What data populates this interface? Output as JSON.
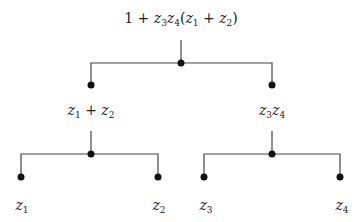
{
  "diagram": {
    "type": "expression-tree",
    "colors": {
      "line": "#444444",
      "node": "#111111",
      "text": "#222222",
      "background": "#ffffff"
    },
    "nodes": [
      {
        "id": "root",
        "label": "1 + z3z4(z1 + z2)",
        "label_parts": [
          "1 + ",
          "z",
          "3",
          "z",
          "4",
          "(",
          "z",
          "1",
          " + ",
          "z",
          "2",
          ")"
        ],
        "x": 181,
        "y": 63,
        "label_x": 181,
        "label_y": 19
      },
      {
        "id": "sum",
        "label": "z1 + z2",
        "x": 91,
        "y": 85,
        "label_x": 91,
        "label_y": 111
      },
      {
        "id": "prod",
        "label": "z3z4",
        "x": 272,
        "y": 85,
        "label_x": 272,
        "label_y": 111
      },
      {
        "id": "z1",
        "label": "z1",
        "x": 21,
        "y": 177,
        "label_x": 21,
        "label_y": 206
      },
      {
        "id": "z2",
        "label": "z2",
        "x": 158,
        "y": 177,
        "label_x": 158,
        "label_y": 206
      },
      {
        "id": "z3",
        "label": "z3",
        "x": 204,
        "y": 177,
        "label_x": 205,
        "label_y": 206
      },
      {
        "id": "z4",
        "label": "z4",
        "x": 340,
        "y": 177,
        "label_x": 341,
        "label_y": 206
      }
    ],
    "edges": [
      {
        "from": "root",
        "to": "sum"
      },
      {
        "from": "root",
        "to": "prod"
      },
      {
        "from": "sum",
        "to": "z1"
      },
      {
        "from": "sum",
        "to": "z2"
      },
      {
        "from": "prod",
        "to": "z3"
      },
      {
        "from": "prod",
        "to": "z4"
      }
    ],
    "labels": {
      "root": {
        "pre": "1 + ",
        "a": "z",
        "a_sub": "3",
        "b": "z",
        "b_sub": "4",
        "open": "(",
        "c": "z",
        "c_sub": "1",
        "plus": " + ",
        "d": "z",
        "d_sub": "2",
        "close": ")"
      },
      "sum": {
        "a": "z",
        "a_sub": "1",
        "plus": " + ",
        "b": "z",
        "b_sub": "2"
      },
      "prod": {
        "a": "z",
        "a_sub": "3",
        "b": "z",
        "b_sub": "4"
      },
      "z1": {
        "a": "z",
        "a_sub": "1"
      },
      "z2": {
        "a": "z",
        "a_sub": "2"
      },
      "z3": {
        "a": "z",
        "a_sub": "3"
      },
      "z4": {
        "a": "z",
        "a_sub": "4"
      }
    }
  }
}
